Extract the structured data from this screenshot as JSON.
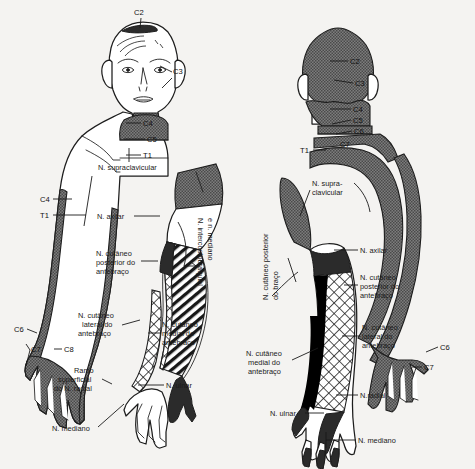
{
  "figure": {
    "background_color": "#f4f3f1",
    "ink_color": "#1d1d1d",
    "shade_color": "#6e6e6e",
    "dark_color": "#2b2b2b",
    "panels": [
      {
        "id": "anterior",
        "view_label": ""
      },
      {
        "id": "posterior",
        "view_label": ""
      }
    ]
  },
  "anterior": {
    "segments": [
      {
        "name": "c2",
        "label": "C2"
      },
      {
        "name": "c3",
        "label": "C3"
      },
      {
        "name": "c4_neck",
        "label": "C4"
      },
      {
        "name": "c5",
        "label": "C5"
      },
      {
        "name": "t1_neck",
        "label": "T1"
      },
      {
        "name": "c4_arm",
        "label": "C4"
      },
      {
        "name": "t1_arm",
        "label": "T1"
      },
      {
        "name": "c6",
        "label": "C6"
      },
      {
        "name": "c7",
        "label": "C7"
      },
      {
        "name": "c8",
        "label": "C8"
      }
    ],
    "nerves": [
      {
        "name": "supraclavicular",
        "label": "N. supraclavicular"
      },
      {
        "name": "axillary",
        "label": "N. axilar"
      },
      {
        "name": "posterior-antebrachial-cutaneous",
        "label": "N. cutâneo posterior do antebraço"
      },
      {
        "name": "intercostobrachial-median",
        "label": "N. intercostobraquial e n. mediano"
      },
      {
        "name": "lateral-antebrachial-cutaneous",
        "label": "N. cutâneo lateral do antebraço"
      },
      {
        "name": "medial-antebrachial-cutaneous",
        "label": "N. cutâneo medial do antebraço"
      },
      {
        "name": "superficial-radial-branch",
        "label": "Ramo superficial do N. radial"
      },
      {
        "name": "ulnar",
        "label": "N. ulnar"
      },
      {
        "name": "median",
        "label": "N. mediano"
      }
    ]
  },
  "posterior": {
    "segments": [
      {
        "name": "c2",
        "label": "C2"
      },
      {
        "name": "c3",
        "label": "C3"
      },
      {
        "name": "c4",
        "label": "C4"
      },
      {
        "name": "c5",
        "label": "C5"
      },
      {
        "name": "c6_neck",
        "label": "C6"
      },
      {
        "name": "c7_neck",
        "label": "C7"
      },
      {
        "name": "t1",
        "label": "T1"
      },
      {
        "name": "c6_hand",
        "label": "C6"
      },
      {
        "name": "c7_hand",
        "label": "C7"
      }
    ],
    "nerves": [
      {
        "name": "supraclavicular",
        "label": "N. supra-\nclavicular",
        "line1": "N. supra-",
        "line2": "clavicular"
      },
      {
        "name": "posterior-brachial-cutaneous",
        "label": "N. cutâneo posterior do braço"
      },
      {
        "name": "axillary",
        "label": "N. axilar"
      },
      {
        "name": "posterior-antebrachial-cutaneous",
        "label": "N. cutâneo posterior do antebraço"
      },
      {
        "name": "lateral-antebrachial-cutaneous",
        "label": "N. cutâneo lateral do antebraço"
      },
      {
        "name": "medial-antebrachial-cutaneous",
        "label": "N. cutâneo medial do antebraço"
      },
      {
        "name": "radial",
        "label": "N.radial"
      },
      {
        "name": "ulnar",
        "label": "N. ulnar"
      },
      {
        "name": "median",
        "label": "N. mediano"
      }
    ]
  },
  "text": {
    "n_cutaneo": "N. cutâneo",
    "posterior_do": "posterior do",
    "lateral_do": "lateral do",
    "medial_do": "medial do",
    "antebraco": "antebraço",
    "ramo": "Ramo",
    "superficial": "superficial",
    "do_n_radial": "do N. radial",
    "n_supra": "N. supra-",
    "clavicular": "clavicular",
    "n_supraclavicular": "N. supraclavicular",
    "n_axilar": "N. axilar",
    "n_ulnar": "N. ulnar",
    "n_mediano": "N. mediano",
    "n_radial": "N.radial",
    "n_intercosto_1": "N. intercostobraquial",
    "n_intercosto_2": "e n. mediano",
    "n_cut_post_braco_1": "N. cutâneo posterior",
    "n_cut_post_braco_2": "do braço"
  }
}
